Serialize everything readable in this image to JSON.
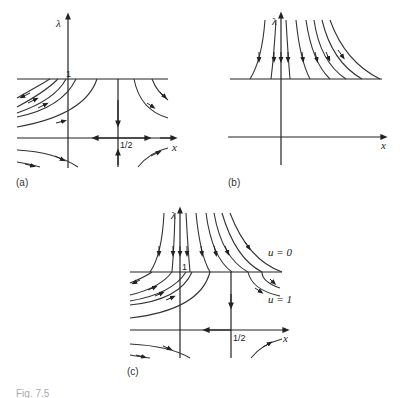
{
  "figure": {
    "caption_fragment": "Fig. 7.5",
    "panels": [
      {
        "id": "a",
        "label": "(a)",
        "axis_labels": {
          "x": "x",
          "y": "λ"
        },
        "tick_labels": {
          "lambda_one": "1",
          "x_half": "1/2"
        },
        "description": "Phase portrait with saddle at (1/2, 0); horizontal invariant line λ = 1"
      },
      {
        "id": "b",
        "label": "(b)",
        "axis_labels": {
          "x": "x",
          "y": "λ"
        },
        "description": "Trajectories above λ = 1 flowing downward onto the line"
      },
      {
        "id": "c",
        "label": "(c)",
        "axis_labels": {
          "x": "x",
          "y": "λ"
        },
        "tick_labels": {
          "lambda_one": "1",
          "x_half": "1/2"
        },
        "curve_labels": {
          "u0": "u = 0",
          "u1": "u = 1"
        },
        "description": "Combined portrait of (a) and (b)"
      }
    ]
  },
  "colors": {
    "ink": "#222222",
    "background": "#ffffff"
  }
}
